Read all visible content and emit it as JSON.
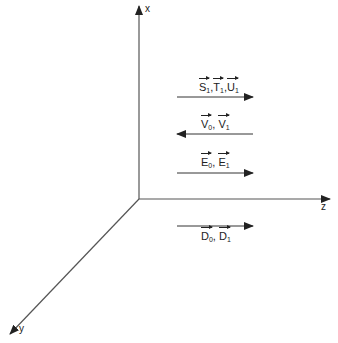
{
  "diagram": {
    "axes": {
      "x_label": "x",
      "y_label": "y",
      "z_label": "z"
    },
    "vectors": [
      {
        "label": "S₁, T₁, U₁",
        "parts": [
          {
            "sym": "S",
            "sub": "1"
          },
          {
            "sym": "T",
            "sub": "1"
          },
          {
            "sym": "U",
            "sub": "1"
          }
        ],
        "direction": "+z"
      },
      {
        "label": "V₀, V₁",
        "parts": [
          {
            "sym": "V",
            "sub": "0"
          },
          {
            "sym": "V",
            "sub": "1"
          }
        ],
        "direction": "-z"
      },
      {
        "label": "E₀, E₁",
        "parts": [
          {
            "sym": "E",
            "sub": "0"
          },
          {
            "sym": "E",
            "sub": "1"
          }
        ],
        "direction": "+z"
      },
      {
        "label": "D₀, D₁",
        "parts": [
          {
            "sym": "D",
            "sub": "0"
          },
          {
            "sym": "D",
            "sub": "1"
          }
        ],
        "direction": "+z"
      }
    ],
    "colors": {
      "line": "#333333",
      "text": "#222222"
    }
  }
}
